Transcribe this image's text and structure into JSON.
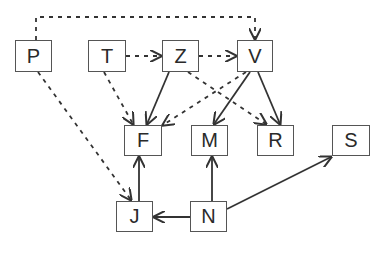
{
  "diagram": {
    "type": "directed-graph",
    "nodes": [
      {
        "id": "P",
        "label": "P",
        "x": 15,
        "y": 40,
        "w": 37,
        "h": 32
      },
      {
        "id": "T",
        "label": "T",
        "x": 88,
        "y": 40,
        "w": 38,
        "h": 32
      },
      {
        "id": "Z",
        "label": "Z",
        "x": 162,
        "y": 40,
        "w": 37,
        "h": 32
      },
      {
        "id": "V",
        "label": "V",
        "x": 237,
        "y": 40,
        "w": 36,
        "h": 32
      },
      {
        "id": "F",
        "label": "F",
        "x": 124,
        "y": 125,
        "w": 38,
        "h": 31
      },
      {
        "id": "M",
        "label": "M",
        "x": 191,
        "y": 125,
        "w": 37,
        "h": 31
      },
      {
        "id": "R",
        "label": "R",
        "x": 257,
        "y": 125,
        "w": 37,
        "h": 31
      },
      {
        "id": "S",
        "label": "S",
        "x": 332,
        "y": 125,
        "w": 38,
        "h": 31
      },
      {
        "id": "J",
        "label": "J",
        "x": 116,
        "y": 201,
        "w": 37,
        "h": 31
      },
      {
        "id": "N",
        "label": "N",
        "x": 190,
        "y": 201,
        "w": 37,
        "h": 31
      }
    ],
    "edges": [
      {
        "from": "P",
        "to": "V",
        "style": "dotted",
        "route": "over-top"
      },
      {
        "from": "P",
        "to": "J",
        "style": "dotted"
      },
      {
        "from": "T",
        "to": "Z",
        "style": "dotted"
      },
      {
        "from": "Z",
        "to": "V",
        "style": "dotted"
      },
      {
        "from": "T",
        "to": "F",
        "style": "dotted"
      },
      {
        "from": "Z",
        "to": "F",
        "style": "solid"
      },
      {
        "from": "V",
        "to": "F",
        "style": "dotted"
      },
      {
        "from": "Z",
        "to": "R",
        "style": "dotted"
      },
      {
        "from": "V",
        "to": "M",
        "style": "solid"
      },
      {
        "from": "V",
        "to": "R",
        "style": "solid"
      },
      {
        "from": "J",
        "to": "F",
        "style": "solid"
      },
      {
        "from": "N",
        "to": "J",
        "style": "solid"
      },
      {
        "from": "N",
        "to": "M",
        "style": "solid"
      },
      {
        "from": "N",
        "to": "S",
        "style": "solid"
      }
    ],
    "colors": {
      "line": "#333333",
      "box_border": "#555555",
      "text": "#2a2a2a"
    }
  }
}
